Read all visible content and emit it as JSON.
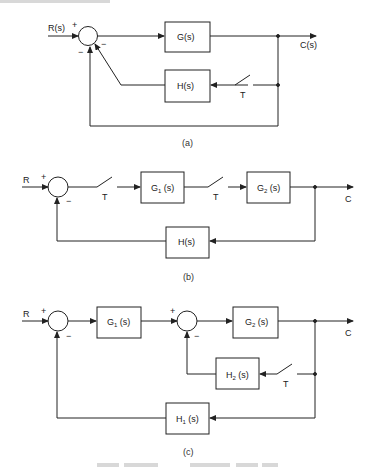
{
  "diagrams": {
    "a": {
      "caption": "(a)",
      "input_label": "R(s)",
      "output_label": "C(s)",
      "sum_signs": {
        "plus": "+",
        "minus_right": "−",
        "minus_bottom": "−"
      },
      "forward_block": "G(s)",
      "feedback_block": "H(s)",
      "sampler_label": "T"
    },
    "b": {
      "caption": "(b)",
      "input_label": "R",
      "output_label": "C",
      "sum_signs": {
        "plus": "+",
        "minus": "−"
      },
      "g1": {
        "main": "G",
        "sub": "1",
        "tail": " (s)"
      },
      "g2": {
        "main": "G",
        "sub": "2",
        "tail": " (s)"
      },
      "feedback_block": "H(s)",
      "sampler1_label": "T",
      "sampler2_label": "T"
    },
    "c": {
      "caption": "(c)",
      "input_label": "R",
      "output_label": "C",
      "sum1_signs": {
        "plus": "+",
        "minus": "−"
      },
      "sum2_signs": {
        "plus": "+",
        "minus": "−"
      },
      "g1": {
        "main": "G",
        "sub": "1",
        "tail": " (s)"
      },
      "g2": {
        "main": "G",
        "sub": "2",
        "tail": " (s)"
      },
      "h1": {
        "main": "H",
        "sub": "1",
        "tail": " (s)"
      },
      "h2": {
        "main": "H",
        "sub": "2",
        "tail": " (s)"
      },
      "sampler_label": "T"
    }
  },
  "colors": {
    "line": "#222222",
    "background": "#ffffff"
  }
}
